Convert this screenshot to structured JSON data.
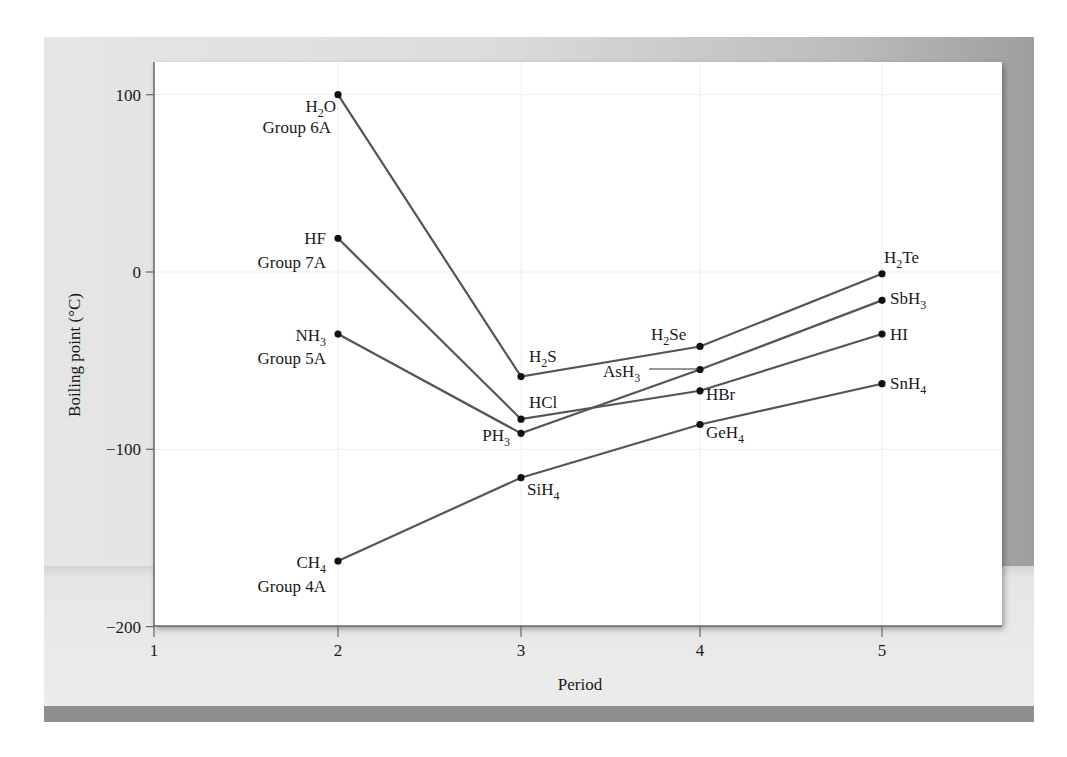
{
  "chart_data": {
    "type": "line",
    "title": "",
    "xlabel": "Period",
    "ylabel": "Boiling point (°C)",
    "xlim": [
      1,
      5.65
    ],
    "ylim": [
      -200,
      120
    ],
    "x_ticks": [
      1,
      2,
      3,
      4,
      5
    ],
    "y_ticks": [
      100,
      0,
      -100,
      -200
    ],
    "y_tick_labels": [
      "100",
      "0",
      "−100",
      "−200"
    ],
    "grid": true,
    "legend": "none (series labeled inline)",
    "series": [
      {
        "name": "Group 6A",
        "x": [
          2,
          3,
          4,
          5
        ],
        "values": [
          100,
          -59,
          -42,
          -1
        ],
        "labels": [
          "H2O",
          "H2S",
          "H2Se",
          "H2Te"
        ]
      },
      {
        "name": "Group 7A",
        "x": [
          2,
          3,
          4,
          5
        ],
        "values": [
          19,
          -83,
          -67,
          -35
        ],
        "labels": [
          "HF",
          "HCl",
          "HBr",
          "HI"
        ]
      },
      {
        "name": "Group 5A",
        "x": [
          2,
          3,
          4,
          5
        ],
        "values": [
          -35,
          -91,
          -55,
          -16
        ],
        "labels": [
          "NH3",
          "PH3",
          "AsH3",
          "SbH3"
        ]
      },
      {
        "name": "Group 4A",
        "x": [
          2,
          3,
          4,
          5
        ],
        "values": [
          -163,
          -116,
          -86,
          -63
        ],
        "labels": [
          "CH4",
          "SiH4",
          "GeH4",
          "SnH4"
        ]
      }
    ],
    "colors": {
      "line": "#555555",
      "marker": "#111111",
      "grid": "#eeeeee",
      "axis": "#666666"
    }
  },
  "point_labels": [
    {
      "id": "h2o",
      "base": "H",
      "sub": "2",
      "tail": "O",
      "x": 336,
      "y": 112,
      "anchor": "end"
    },
    {
      "id": "hf",
      "base": "HF",
      "sub": "",
      "tail": "",
      "x": 326,
      "y": 244,
      "anchor": "end"
    },
    {
      "id": "nh3",
      "base": "NH",
      "sub": "3",
      "tail": "",
      "x": 326,
      "y": 341,
      "anchor": "end"
    },
    {
      "id": "ch4",
      "base": "CH",
      "sub": "4",
      "tail": "",
      "x": 326,
      "y": 568,
      "anchor": "end"
    },
    {
      "id": "h2s",
      "base": "H",
      "sub": "2",
      "tail": "S",
      "x": 529,
      "y": 362,
      "anchor": "start"
    },
    {
      "id": "hcl",
      "base": "HCl",
      "sub": "",
      "tail": "",
      "x": 529,
      "y": 408,
      "anchor": "start"
    },
    {
      "id": "ph3",
      "base": "PH",
      "sub": "3",
      "tail": "",
      "x": 510,
      "y": 441,
      "anchor": "end"
    },
    {
      "id": "sih4",
      "base": "SiH",
      "sub": "4",
      "tail": "",
      "x": 527,
      "y": 495,
      "anchor": "start"
    },
    {
      "id": "h2se",
      "base": "H",
      "sub": "2",
      "tail": "Se",
      "x": 651,
      "y": 340,
      "anchor": "start"
    },
    {
      "id": "ash3",
      "base": "AsH",
      "sub": "3",
      "tail": "",
      "x": 603,
      "y": 377,
      "anchor": "start"
    },
    {
      "id": "hbr",
      "base": "HBr",
      "sub": "",
      "tail": "",
      "x": 706,
      "y": 400,
      "anchor": "start"
    },
    {
      "id": "geh4",
      "base": "GeH",
      "sub": "4",
      "tail": "",
      "x": 706,
      "y": 438,
      "anchor": "start"
    },
    {
      "id": "h2te",
      "base": "H",
      "sub": "2",
      "tail": "Te",
      "x": 884,
      "y": 263,
      "anchor": "start"
    },
    {
      "id": "sbh3",
      "base": "SbH",
      "sub": "3",
      "tail": "",
      "x": 890,
      "y": 304,
      "anchor": "start"
    },
    {
      "id": "hi",
      "base": "HI",
      "sub": "",
      "tail": "",
      "x": 890,
      "y": 340,
      "anchor": "start"
    },
    {
      "id": "snh4",
      "base": "SnH",
      "sub": "4",
      "tail": "",
      "x": 890,
      "y": 389,
      "anchor": "start"
    }
  ],
  "group_labels": [
    {
      "text": "Group 6A",
      "x": 331,
      "y": 133
    },
    {
      "text": "Group 7A",
      "x": 326,
      "y": 268
    },
    {
      "text": "Group 5A",
      "x": 326,
      "y": 364
    },
    {
      "text": "Group 4A",
      "x": 326,
      "y": 592
    }
  ],
  "leader": {
    "label": "AsH3",
    "x1": 649,
    "y1": 369,
    "x2": 698,
    "y2": 369
  }
}
